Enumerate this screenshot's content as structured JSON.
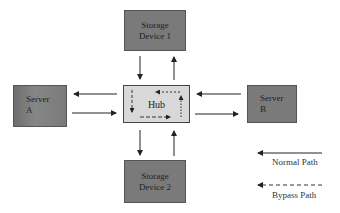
{
  "diagram": {
    "nodes": {
      "storage1": {
        "line1": "Storage",
        "line2": "Device 1"
      },
      "storage2": {
        "line1": "Storage",
        "line2": "Device 2"
      },
      "serverA": {
        "line1": "Server",
        "line2": "A"
      },
      "serverB": {
        "line1": "Server",
        "line2": "B"
      },
      "hub": {
        "label": "Hub"
      }
    },
    "legend": {
      "normal": "Normal Path",
      "bypass": "Bypass Path"
    },
    "colors": {
      "node_fill": "#7a7a7a",
      "hub_fill": "#d8d8d8",
      "line": "#222222"
    }
  }
}
